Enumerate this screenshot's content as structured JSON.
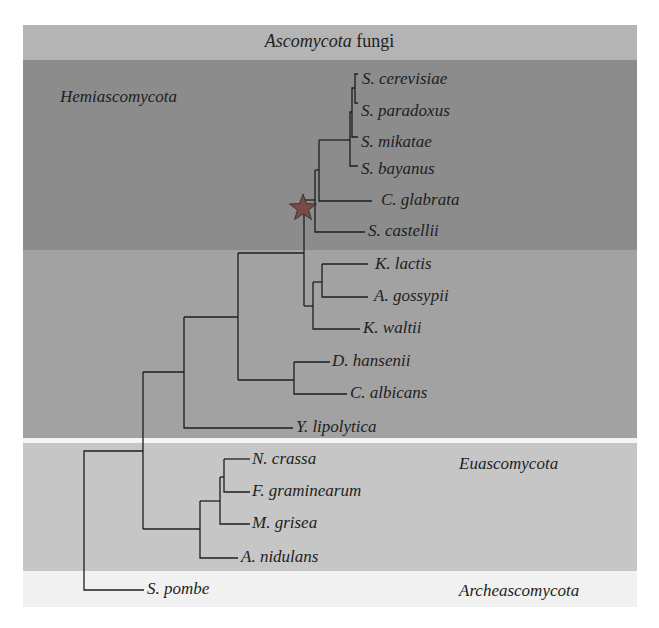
{
  "title": {
    "italic": "Ascomycota",
    "plain": " fungi"
  },
  "clades": {
    "hemiascomycota": "Hemiascomycota",
    "euascomycota": "Euascomycota",
    "archeascomycota": "Archeascomycota"
  },
  "colors": {
    "title_band": "#b4b4b4",
    "hemi_upper_band": "#8c8c8c",
    "hemi_lower_band": "#a2a2a2",
    "euascomycota_band": "#c6c6c6",
    "archeascomycota_band": "#f1f1f1",
    "branch": "#1e1e1e",
    "star": "#7a4a4a"
  },
  "marker": {
    "type": "star-icon",
    "meaning": "node marker"
  },
  "taxa": [
    {
      "name": "S. cerevisiae",
      "x": 362,
      "y": 80
    },
    {
      "name": "S. paradoxus",
      "x": 361,
      "y": 112
    },
    {
      "name": "S. mikatae",
      "x": 361,
      "y": 143
    },
    {
      "name": "S. bayanus",
      "x": 361,
      "y": 170
    },
    {
      "name": "C. glabrata",
      "x": 381,
      "y": 201
    },
    {
      "name": "S. castellii",
      "x": 368,
      "y": 232
    },
    {
      "name": "K. lactis",
      "x": 375,
      "y": 265
    },
    {
      "name": "A. gossypii",
      "x": 374,
      "y": 297
    },
    {
      "name": "K. waltii",
      "x": 363,
      "y": 329
    },
    {
      "name": "D. hansenii",
      "x": 332,
      "y": 362
    },
    {
      "name": "C. albicans",
      "x": 350,
      "y": 394
    },
    {
      "name": "Y. lipolytica",
      "x": 296,
      "y": 428
    },
    {
      "name": "N. crassa",
      "x": 252,
      "y": 460
    },
    {
      "name": "F. graminearum",
      "x": 252,
      "y": 492
    },
    {
      "name": "M. grisea",
      "x": 252,
      "y": 524
    },
    {
      "name": "A. nidulans",
      "x": 241,
      "y": 558
    },
    {
      "name": "S. pombe",
      "x": 147,
      "y": 590
    }
  ]
}
